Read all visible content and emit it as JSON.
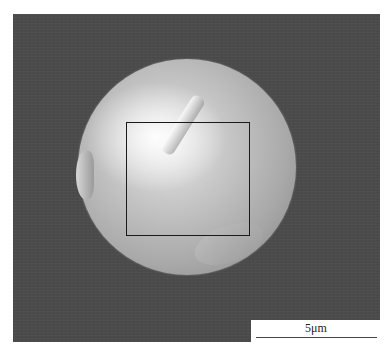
{
  "image": {
    "type": "SEM micrograph",
    "subject": "spherical particle with marked region of interest",
    "background_color": "#4b4b4b",
    "roi_box": {
      "present": true,
      "color": "#1a1a1a"
    }
  },
  "scale_bar": {
    "label": "5μm"
  }
}
